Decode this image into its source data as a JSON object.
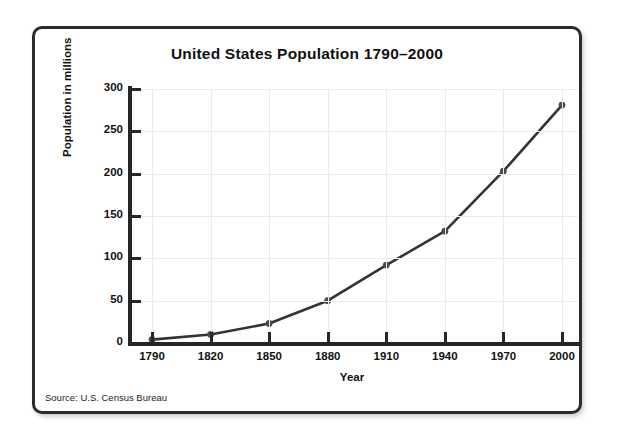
{
  "chart_data": {
    "type": "line",
    "title": "United States Population 1790–2000",
    "xlabel": "Year",
    "ylabel": "Population in millions",
    "x": [
      1790,
      1820,
      1850,
      1880,
      1910,
      1940,
      1970,
      2000
    ],
    "categories": [
      "1790",
      "1820",
      "1850",
      "1880",
      "1910",
      "1940",
      "1970",
      "2000"
    ],
    "values": [
      4,
      10,
      23,
      50,
      92,
      132,
      203,
      281
    ],
    "xtick_labels": [
      "1790",
      "1820",
      "1850",
      "1880",
      "1910",
      "1940",
      "1970",
      "2000"
    ],
    "ytick_labels": [
      "0",
      "50",
      "100",
      "150",
      "200",
      "250",
      "300"
    ],
    "ytick_values": [
      0,
      50,
      100,
      150,
      200,
      250,
      300
    ],
    "xlim": [
      1790,
      2000
    ],
    "ylim": [
      0,
      300
    ],
    "grid": true,
    "legend": false,
    "series": [
      {
        "name": "United States Population",
        "values": [
          4,
          10,
          23,
          50,
          92,
          132,
          203,
          281
        ],
        "marker": "circle",
        "color": "#333333"
      }
    ],
    "source": "Source: U.S. Census Bureau",
    "colors": {
      "line": "#333333",
      "marker": "#4a4a4a",
      "axis": "#262626",
      "grid": "#ebebeb",
      "border": "#2b2b2b",
      "background": "#ffffff",
      "text": "#111111"
    }
  }
}
